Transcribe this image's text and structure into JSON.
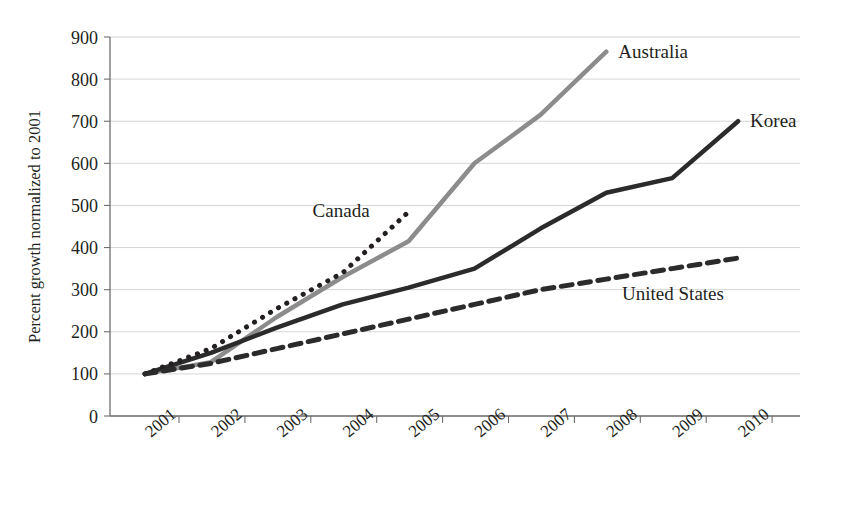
{
  "chart_data": {
    "type": "line",
    "title": "",
    "xlabel": "",
    "ylabel": "Percent growth normalized to 2001",
    "x": [
      2001,
      2002,
      2003,
      2004,
      2005,
      2006,
      2007,
      2008,
      2009,
      2010
    ],
    "xtick_labels": [
      "2001",
      "2002",
      "2003",
      "2004",
      "2005",
      "2006",
      "2007",
      "2008",
      "2009",
      "2010"
    ],
    "ytick_labels": [
      "0",
      "100",
      "200",
      "300",
      "400",
      "500",
      "600",
      "700",
      "800",
      "900"
    ],
    "ytick_values": [
      0,
      100,
      200,
      300,
      400,
      500,
      600,
      700,
      800,
      900
    ],
    "ylim": [
      0,
      900
    ],
    "xlim": [
      2001,
      2010
    ],
    "grid": "horizontal",
    "legend_position": "inline-end-of-line",
    "series": [
      {
        "name": "Australia",
        "label": "Australia",
        "color": "#8c8c8c",
        "style": "solid",
        "width": 4.5,
        "values": [
          100,
          128,
          235,
          330,
          415,
          600,
          715,
          865,
          null,
          null
        ]
      },
      {
        "name": "Korea",
        "label": "Korea",
        "color": "#2b2b2b",
        "style": "solid",
        "width": 4.5,
        "values": [
          100,
          150,
          210,
          265,
          305,
          350,
          445,
          530,
          565,
          700
        ]
      },
      {
        "name": "Canada",
        "label": "Canada",
        "color": "#231f20",
        "style": "dotted",
        "width": 5,
        "values": [
          100,
          160,
          255,
          340,
          485,
          null,
          null,
          null,
          null,
          null
        ]
      },
      {
        "name": "United States",
        "label": "United States",
        "color": "#2b2b2b",
        "style": "dashed",
        "width": 5,
        "values": [
          100,
          125,
          160,
          195,
          230,
          265,
          300,
          325,
          350,
          375
        ]
      }
    ]
  }
}
